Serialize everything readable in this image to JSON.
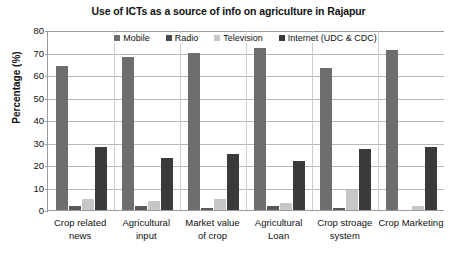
{
  "chart_data": {
    "type": "bar",
    "title": "Use of ICTs as a source of info on agriculture in Rajapur",
    "xlabel": "",
    "ylabel": "Percentage (%)",
    "ylim": [
      0,
      80
    ],
    "ytick_step": 10,
    "yticks": [
      80,
      70,
      60,
      50,
      40,
      30,
      20,
      10,
      0
    ],
    "grid": true,
    "legend_position": "top-center",
    "categories": [
      "Crop related news",
      "Agricultural input",
      "Market value of crop",
      "Agricultural Loan",
      "Crop stroage system",
      "Crop Marketing"
    ],
    "category_lines": [
      [
        "Crop related",
        "news"
      ],
      [
        "Agricultural",
        "input"
      ],
      [
        "Market value",
        "of crop"
      ],
      [
        "Agricultural",
        "Loan"
      ],
      [
        "Crop stroage",
        "system"
      ],
      [
        "Crop Marketing",
        ""
      ]
    ],
    "series": [
      {
        "name": "Mobile",
        "color": "#6e6e6e",
        "values": [
          64,
          68,
          70,
          72,
          63,
          71
        ]
      },
      {
        "name": "Radio",
        "color": "#595959",
        "values": [
          2,
          2,
          1,
          2,
          1,
          0
        ]
      },
      {
        "name": "Television",
        "color": "#c6c6c6",
        "values": [
          5,
          4,
          5,
          3,
          9,
          2
        ]
      },
      {
        "name": "Internet (UDC & CDC)",
        "color": "#3a3a3a",
        "values": [
          28,
          23,
          25,
          22,
          27,
          28
        ]
      }
    ]
  }
}
